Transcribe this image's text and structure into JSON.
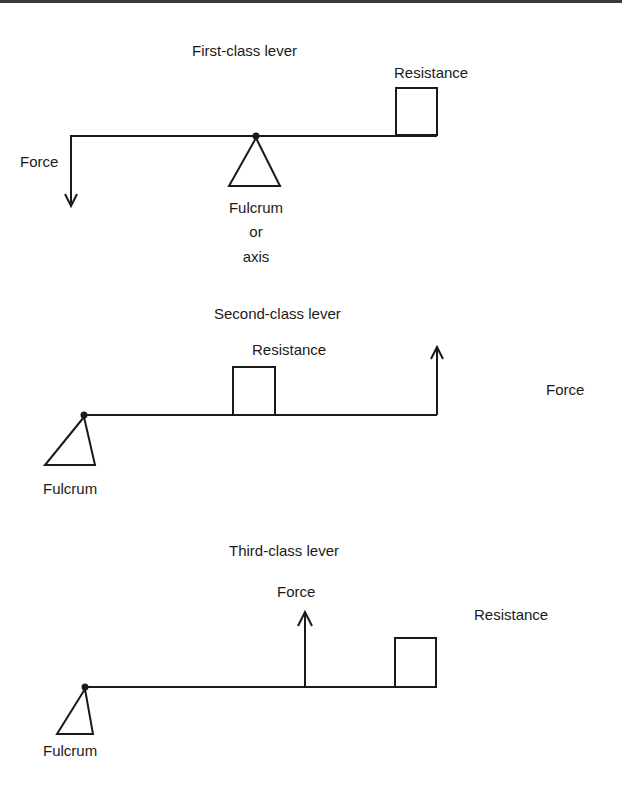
{
  "diagrams": [
    {
      "title": "First-class lever",
      "labels": {
        "force": "Force",
        "resistance": "Resistance",
        "fulcrum": "Fulcrum",
        "fulcrum_line2": "or",
        "fulcrum_line3": "axis"
      }
    },
    {
      "title": "Second-class lever",
      "labels": {
        "force": "Force",
        "resistance": "Resistance",
        "fulcrum": "Fulcrum"
      }
    },
    {
      "title": "Third-class lever",
      "labels": {
        "force": "Force",
        "resistance": "Resistance",
        "fulcrum": "Fulcrum"
      }
    }
  ],
  "colors": {
    "stroke": "#1a1a1a",
    "background": "#ffffff"
  }
}
